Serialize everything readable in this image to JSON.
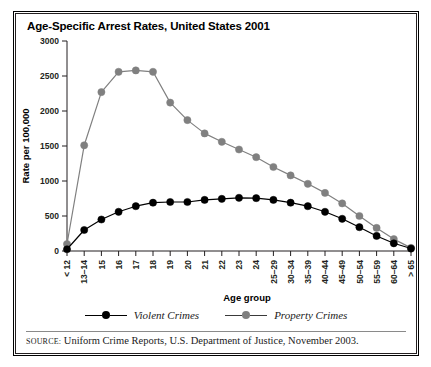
{
  "figure": {
    "title": "Age-Specific Arrest Rates, United States 2001",
    "source_keyword": "SOURCE:",
    "source_text": "Uniform Crime Reports, U.S. Department of Justice, November 2003."
  },
  "legend": {
    "position": "bottom",
    "items": [
      {
        "label": "Violent Crimes",
        "color": "#000000"
      },
      {
        "label": "Property Crimes",
        "color": "#808080"
      }
    ]
  },
  "chart_data": {
    "type": "line",
    "title": "Age-Specific Arrest Rates, United States 2001",
    "xlabel": "Age group",
    "ylabel": "Rate per 100,000",
    "ylim": [
      0,
      3000
    ],
    "yticks": [
      0,
      500,
      1000,
      1500,
      2000,
      2500,
      3000
    ],
    "ytick_labels": [
      "0",
      "500",
      "1000",
      "1500",
      "2000",
      "2500",
      "3000"
    ],
    "grid": false,
    "legend_position": "bottom",
    "categories": [
      "< 12",
      "13–14",
      "15",
      "16",
      "17",
      "18",
      "19",
      "20",
      "21",
      "22",
      "23",
      "24",
      "25–29",
      "30–34",
      "35–39",
      "40–44",
      "45–49",
      "50–54",
      "55–59",
      "60–64",
      "> 65"
    ],
    "series": [
      {
        "name": "Violent Crimes",
        "color": "#000000",
        "values": [
          25,
          300,
          450,
          560,
          640,
          690,
          700,
          700,
          730,
          745,
          760,
          755,
          730,
          690,
          640,
          560,
          460,
          340,
          215,
          110,
          35
        ]
      },
      {
        "name": "Property Crimes",
        "color": "#808080",
        "values": [
          100,
          1510,
          2270,
          2560,
          2580,
          2560,
          2120,
          1870,
          1680,
          1560,
          1450,
          1340,
          1200,
          1080,
          960,
          830,
          680,
          500,
          330,
          170,
          45
        ]
      }
    ]
  }
}
